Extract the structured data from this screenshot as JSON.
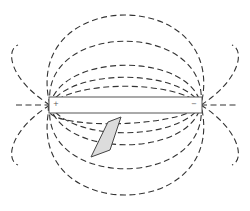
{
  "diagram": {
    "colors": {
      "line": "#333333",
      "rod_border": "#555555",
      "patch_fill": "#dcdcdc",
      "background": "#ffffff"
    },
    "rod": {
      "x": 49,
      "y": 97,
      "width": 153,
      "height": 16
    },
    "labels": {
      "positive": "+",
      "negative": "−"
    },
    "patch": {
      "points": "108,122 121,117 110,150 91,157"
    },
    "field_lines": [
      "M50,105 C75,80 175,80 201,105",
      "M50,105 C70,68 180,68 201,105",
      "M50,105 C62,52 190,52 201,105",
      "M50,105 C40,20 210,20 201,105",
      "M50,105 C20,-15 230,-15 201,105",
      "M50,105 C30,130 180,130 201,105",
      "M50,105 C70,142 180,142 201,105",
      "M50,105 C62,158 190,158 201,105",
      "M50,105 C40,190 210,190 201,105",
      "M50,105 C20,225 230,225 201,105",
      "M50,105 C10,80 5,50 18,45",
      "M50,105 C10,130 5,160 18,165",
      "M201,105 C240,80 245,50 232,45",
      "M201,105 C240,130 245,160 232,165",
      "M16,105 L50,105",
      "M201,105 L236,105"
    ]
  }
}
